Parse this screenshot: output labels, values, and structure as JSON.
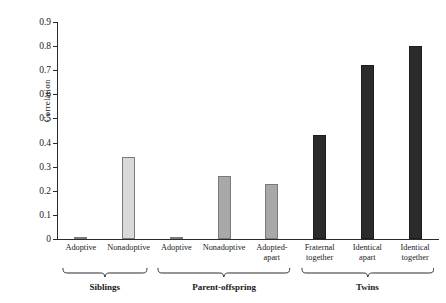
{
  "chart_data": {
    "type": "bar",
    "title": "",
    "xlabel": "",
    "ylabel": "Correlation",
    "ylim": [
      0,
      0.9
    ],
    "ytick_labels": [
      "0.9",
      "0.8",
      "0.7",
      "0.6",
      "0.5",
      "0.4",
      "0.3",
      "0.2",
      "0.1",
      "0"
    ],
    "ytick_values": [
      0.9,
      0.8,
      0.7,
      0.6,
      0.5,
      0.4,
      0.3,
      0.2,
      0.1,
      0
    ],
    "grid": false,
    "legend": null,
    "categories": [
      "Adoptive",
      "Nonadoptive",
      "Adoptive",
      "Nonadoptive",
      "Adopted-\napart",
      "Fraternal\ntogether",
      "Identical\napart",
      "Identical\ntogether"
    ],
    "values": [
      0.01,
      0.34,
      0.005,
      0.26,
      0.23,
      0.43,
      0.72,
      0.8
    ],
    "bar_colors": [
      "#d9d9d9",
      "#d9d9d9",
      "#a8a8a8",
      "#a8a8a8",
      "#a8a8a8",
      "#2b2b2b",
      "#2b2b2b",
      "#2b2b2b"
    ],
    "groups": [
      {
        "label": "Siblings",
        "start_index": 0,
        "end_index": 1
      },
      {
        "label": "Parent-offspring",
        "start_index": 2,
        "end_index": 4
      },
      {
        "label": "Twins",
        "start_index": 5,
        "end_index": 7
      }
    ]
  },
  "colors": {
    "axis": "#2b2b2b",
    "light_gray_bar": "#d9d9d9",
    "mid_gray_bar": "#a8a8a8",
    "dark_bar": "#2b2b2b",
    "background": "#ffffff"
  }
}
